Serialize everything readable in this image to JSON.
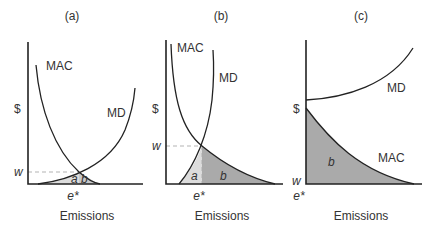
{
  "colors": {
    "light_fill": "#dcdcdc",
    "dark_fill": "#aaaaaa",
    "line": "#222222",
    "dash": "#aaaaaa"
  },
  "panels": [
    {
      "title": "(a)",
      "curves": {
        "mac": "MAC",
        "md": "MD"
      },
      "y_label": "$",
      "w_label": "w",
      "e_label": "e*",
      "x_label": "Emissions",
      "areas": {
        "a": "a",
        "b": "b"
      }
    },
    {
      "title": "(b)",
      "curves": {
        "mac": "MAC",
        "md": "MD"
      },
      "y_label": "$",
      "w_label": "w",
      "e_label": "e*",
      "x_label": "Emissions",
      "areas": {
        "a": "a",
        "b": "b"
      }
    },
    {
      "title": "(c)",
      "curves": {
        "mac": "MAC",
        "md": "MD"
      },
      "y_label": "$",
      "w_label": "w",
      "e_label": "e*",
      "x_label": "Emissions",
      "areas": {
        "b": "b"
      }
    }
  ]
}
